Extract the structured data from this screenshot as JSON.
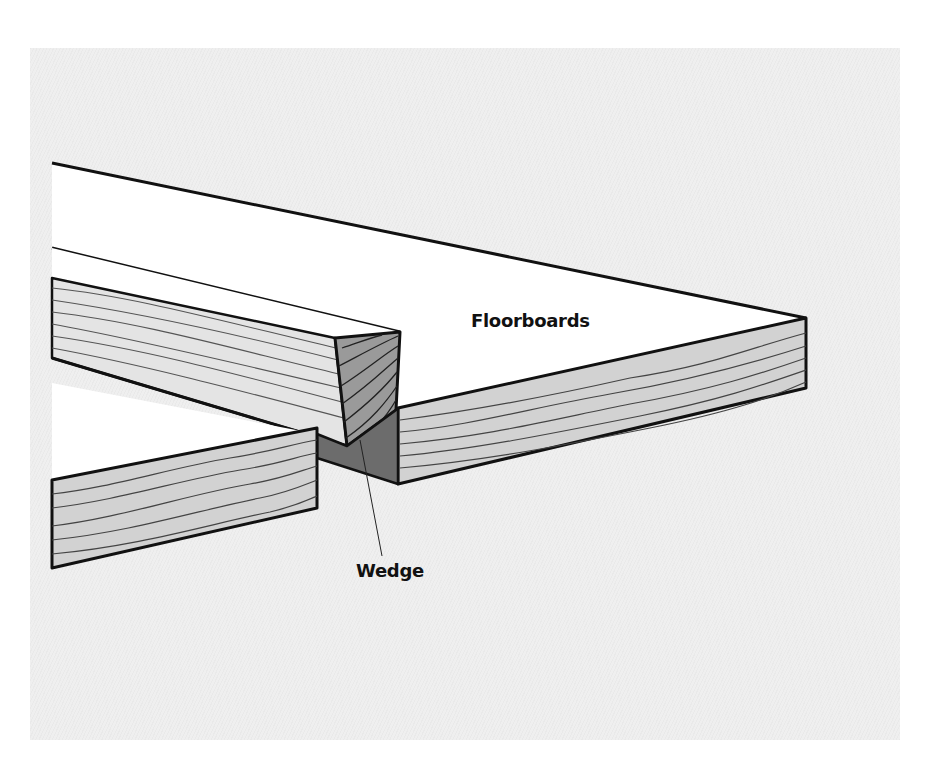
{
  "diagram": {
    "labels": {
      "floorboards": "Floorboards",
      "wedge": "Wedge"
    },
    "colors": {
      "background": "#efefef",
      "board_top": "#ffffff",
      "board_side": "#d4d4d4",
      "end_grain": "#9a9a9a",
      "wedge": "#6e6e6e",
      "outline": "#111111"
    }
  }
}
